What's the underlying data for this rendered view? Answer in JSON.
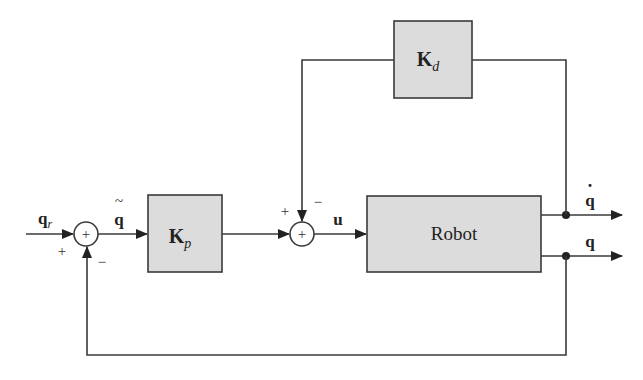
{
  "diagram": {
    "type": "block-diagram",
    "title": "",
    "blocks": {
      "kd": {
        "symbol": "K",
        "subscript": "d"
      },
      "kp": {
        "symbol": "K",
        "subscript": "p"
      },
      "robot": {
        "label": "Robot"
      }
    },
    "signals": {
      "reference": {
        "symbol": "q",
        "subscript": "r"
      },
      "error": {
        "symbol": "q",
        "accent": "~"
      },
      "control": {
        "symbol": "u"
      },
      "velocity": {
        "symbol": "q",
        "accent": "·"
      },
      "position": {
        "symbol": "q"
      }
    },
    "summing_junctions": {
      "sum1": {
        "plus": "+",
        "minus": "−",
        "glyph": "+"
      },
      "sum2": {
        "plus": "+",
        "minus": "−",
        "glyph": "+"
      }
    },
    "colors": {
      "block_fill": "#dcdcdc",
      "line": "#3a3a3a",
      "background": "#ffffff"
    }
  }
}
